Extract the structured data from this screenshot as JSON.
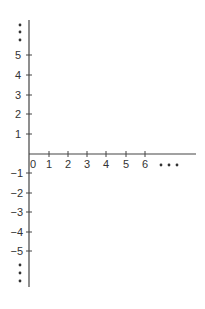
{
  "diagram": {
    "type": "coordinate-axes",
    "origin_label": "0",
    "x_axis": {
      "ticks": [
        "1",
        "2",
        "3",
        "4",
        "5",
        "6"
      ],
      "continuation": "• • •"
    },
    "y_axis": {
      "positive_ticks": [
        "5",
        "4",
        "3",
        "2",
        "1"
      ],
      "negative_ticks": [
        "−1",
        "−2",
        "−3",
        "−4",
        "−5"
      ],
      "top_continuation": "⋮",
      "bottom_continuation": "⋮"
    },
    "colors": {
      "axis": "#444444",
      "text": "#333333"
    }
  }
}
